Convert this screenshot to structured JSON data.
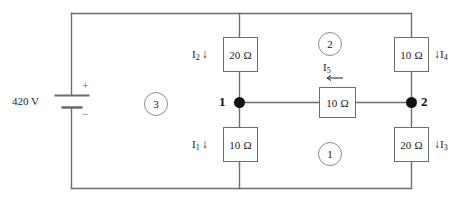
{
  "diagram": {
    "colors": {
      "wire": "#6e6e6e",
      "node": "#111111",
      "text": "#1a1a1a",
      "loop_outline": "#8c8c8c",
      "background": "#ffffff"
    }
  },
  "source": {
    "name": "battery",
    "voltage_label": "420 V",
    "plus_sign": "+",
    "minus_sign": "−"
  },
  "resistors": [
    {
      "id": "R2_top_middle",
      "value": "20 Ω"
    },
    {
      "id": "R1_bottom_middle",
      "value": "10 Ω"
    },
    {
      "id": "R4_top_right",
      "value": "10 Ω"
    },
    {
      "id": "R3_bottom_right",
      "value": "20 Ω"
    },
    {
      "id": "R5_center",
      "value": "10 Ω"
    }
  ],
  "currents": [
    {
      "id": "I2",
      "name": "I",
      "sub": "2",
      "arrow": "↓",
      "position": "left-of-top-middle-resistor"
    },
    {
      "id": "I1",
      "name": "I",
      "sub": "1",
      "arrow": "↓",
      "position": "left-of-bottom-middle-resistor"
    },
    {
      "id": "I4",
      "name": "I",
      "sub": "4",
      "arrow": "↓",
      "position": "right-of-top-right-resistor"
    },
    {
      "id": "I3",
      "name": "I",
      "sub": "3",
      "arrow": "↓",
      "position": "right-of-bottom-right-resistor"
    },
    {
      "id": "I5",
      "name": "I",
      "sub": "5",
      "arrow": "←",
      "position": "above-center-resistor"
    }
  ],
  "nodes": [
    {
      "id": "node1",
      "label": "1"
    },
    {
      "id": "node2",
      "label": "2"
    }
  ],
  "loops": [
    {
      "id": "loop1",
      "label": "1",
      "position": "bottom-center"
    },
    {
      "id": "loop2",
      "label": "2",
      "position": "top-center"
    },
    {
      "id": "loop3",
      "label": "3",
      "position": "left-center"
    }
  ]
}
